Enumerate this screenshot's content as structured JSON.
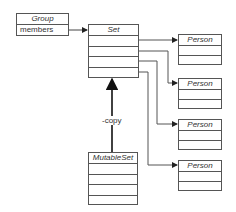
{
  "diagram": {
    "group": {
      "title": "Group",
      "fields": [
        "members"
      ]
    },
    "set": {
      "title": "Set",
      "rows": 4
    },
    "mutable_set": {
      "title": "MutableSet",
      "rows": 4
    },
    "persons": [
      {
        "title": "Person",
        "rows": 2
      },
      {
        "title": "Person",
        "rows": 2
      },
      {
        "title": "Person",
        "rows": 2
      },
      {
        "title": "Person",
        "rows": 2
      }
    ],
    "relations": [
      {
        "from": "Group.members",
        "to": "Set",
        "type": "reference"
      },
      {
        "from": "Set.row1",
        "to": "Person1",
        "type": "reference"
      },
      {
        "from": "Set.row2",
        "to": "Person2",
        "type": "reference"
      },
      {
        "from": "Set.row3",
        "to": "Person3",
        "type": "reference"
      },
      {
        "from": "Set.row4",
        "to": "Person4",
        "type": "reference"
      },
      {
        "from": "MutableSet",
        "to": "Set",
        "type": "inheritance",
        "label": "-copy"
      }
    ],
    "inherit_label": "-copy",
    "line_color": "#555555"
  }
}
